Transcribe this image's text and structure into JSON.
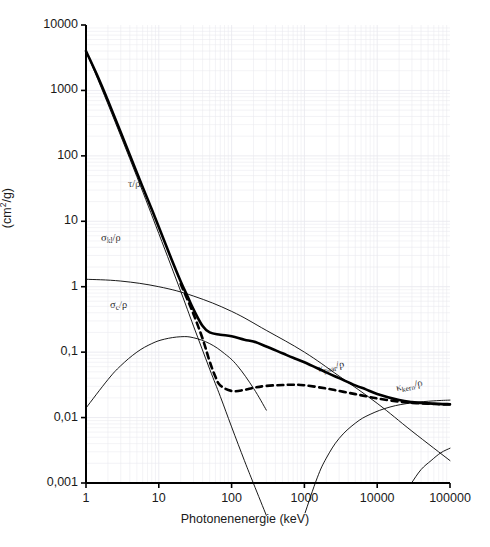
{
  "figure": {
    "background": "#ffffff",
    "axis_color": "#000000",
    "grid_color": "#e9e9ef"
  },
  "axes": {
    "x_label": "Photonenenergie (keV)",
    "y_label_prefix": "(cm",
    "y_label_exponent": "2",
    "y_label_suffix": "/g)",
    "x_ticks": [
      "1",
      "10",
      "100",
      "1000",
      "10000",
      "100000"
    ],
    "y_ticks": [
      "10000",
      "1000",
      "100",
      "10",
      "1",
      "0,1",
      "0,01",
      "0,001"
    ]
  },
  "curve_labels": [
    {
      "name": "tau-rho",
      "text": "τ/ρ",
      "x": 128,
      "y": 178
    },
    {
      "name": "sigma-kl-rho",
      "base": "σ",
      "sub": "kl",
      "tail": "/ρ",
      "x": 101,
      "y": 232
    },
    {
      "name": "sigma-c-rho",
      "base": "σ",
      "sub": "c",
      "tail": "/ρ",
      "x": 110,
      "y": 299
    },
    {
      "name": "kappa-paar-rho",
      "base": "κ",
      "sub": "paar",
      "tail": "/ρ",
      "x": 318,
      "y": 363
    },
    {
      "name": "kappa-kern-rho",
      "base": "κ",
      "sub": "kern",
      "tail": "/ρ",
      "x": 396,
      "y": 382
    }
  ],
  "chart_data": {
    "type": "line",
    "title": "",
    "xlabel": "Photonenenergie (keV)",
    "ylabel": "(cm2/g)",
    "xscale": "log",
    "yscale": "log",
    "xlim": [
      1,
      100000
    ],
    "ylim": [
      0.001,
      10000
    ],
    "grid": true,
    "legend": "inline-curve-labels",
    "series": [
      {
        "name": "μ/ρ (Gesamtschwächungskoeffizient)",
        "style": "solid-thick",
        "color": "#000000",
        "x": [
          1,
          1.5,
          2,
          3,
          5,
          7,
          10,
          15,
          20,
          25,
          30,
          40,
          50,
          70,
          100,
          150,
          200,
          300,
          500,
          700,
          1000,
          2000,
          3000,
          5000,
          7000,
          10000,
          20000,
          30000,
          50000,
          70000,
          100000
        ],
        "y": [
          4000,
          1500,
          700,
          230,
          55,
          22,
          8.2,
          2.6,
          1.2,
          0.7,
          0.45,
          0.25,
          0.2,
          0.185,
          0.175,
          0.155,
          0.145,
          0.122,
          0.096,
          0.082,
          0.07,
          0.049,
          0.04,
          0.031,
          0.027,
          0.023,
          0.0185,
          0.0172,
          0.0165,
          0.0162,
          0.016
        ]
      },
      {
        "name": "μ_en/ρ (Energieabsorption, gestrichelt)",
        "style": "dashed-thick",
        "color": "#000000",
        "x": [
          20,
          25,
          30,
          40,
          50,
          60,
          70,
          100,
          150,
          200,
          300,
          500,
          700,
          1000,
          2000,
          3000,
          5000,
          7000,
          10000,
          20000,
          30000,
          50000,
          70000,
          100000
        ],
        "y": [
          1.1,
          0.62,
          0.38,
          0.16,
          0.072,
          0.042,
          0.031,
          0.0255,
          0.0265,
          0.0285,
          0.0305,
          0.0315,
          0.0318,
          0.0312,
          0.0278,
          0.0255,
          0.0228,
          0.0212,
          0.0196,
          0.0175,
          0.0168,
          0.0163,
          0.016,
          0.0158
        ]
      },
      {
        "name": "τ/ρ (Photoeffekt)",
        "style": "solid-thin",
        "color": "#000000",
        "x": [
          1,
          2,
          5,
          10,
          20,
          30,
          50,
          70,
          100,
          150,
          200,
          300
        ],
        "y": [
          4000,
          620,
          48,
          6.5,
          0.85,
          0.25,
          0.055,
          0.021,
          0.0072,
          0.0022,
          0.00098,
          0.00032
        ]
      },
      {
        "name": "σ_kl/ρ (Klein-Nishina-Streuung)",
        "style": "solid-thin",
        "color": "#000000",
        "x": [
          1,
          3,
          10,
          30,
          100,
          300,
          1000,
          3000,
          10000,
          30000,
          100000
        ],
        "y": [
          1.3,
          1.22,
          1.0,
          0.72,
          0.42,
          0.215,
          0.1,
          0.043,
          0.0165,
          0.0062,
          0.0022
        ]
      },
      {
        "name": "σ_c/ρ (kohärente Streuung)",
        "style": "solid-thin",
        "color": "#000000",
        "x": [
          1,
          2,
          3,
          5,
          8,
          12,
          20,
          30,
          50,
          80,
          120,
          200,
          300
        ],
        "y": [
          0.014,
          0.038,
          0.062,
          0.1,
          0.135,
          0.158,
          0.172,
          0.166,
          0.135,
          0.095,
          0.062,
          0.028,
          0.013
        ]
      },
      {
        "name": "κ_paar/ρ (Paarbildung im Kernfeld)",
        "style": "solid-thin",
        "color": "#000000",
        "x": [
          1022,
          1500,
          2000,
          3000,
          5000,
          8000,
          15000,
          30000,
          60000,
          100000
        ],
        "y": [
          0.00035,
          0.0012,
          0.0024,
          0.0048,
          0.0082,
          0.0112,
          0.0145,
          0.0168,
          0.018,
          0.0185
        ]
      },
      {
        "name": "κ_kern/ρ (Paarbildung im Hüllenfeld)",
        "style": "solid-thin",
        "color": "#000000",
        "x": [
          30000,
          40000,
          55000,
          75000,
          100000
        ],
        "y": [
          0.00102,
          0.0016,
          0.0022,
          0.0029,
          0.0034
        ]
      }
    ]
  }
}
